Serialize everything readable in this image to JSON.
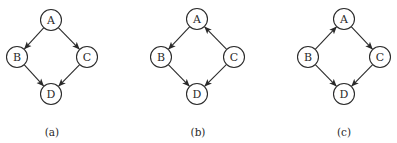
{
  "diagrams": [
    {
      "caption": "(a)",
      "caption_pos": [
        52,
        132
      ],
      "nodes": [
        {
          "id": "A",
          "label": "A",
          "x": 51,
          "y": 20
        },
        {
          "id": "B",
          "label": "B",
          "x": 17,
          "y": 57
        },
        {
          "id": "C",
          "label": "C",
          "x": 87,
          "y": 57
        },
        {
          "id": "D",
          "label": "D",
          "x": 51,
          "y": 94
        }
      ],
      "edges": [
        {
          "from": "A",
          "to": "B"
        },
        {
          "from": "A",
          "to": "C"
        },
        {
          "from": "B",
          "to": "D"
        },
        {
          "from": "C",
          "to": "D"
        }
      ]
    },
    {
      "caption": "(b)",
      "caption_pos": [
        198,
        132
      ],
      "nodes": [
        {
          "id": "A",
          "label": "A",
          "x": 197,
          "y": 19
        },
        {
          "id": "B",
          "label": "B",
          "x": 161,
          "y": 57
        },
        {
          "id": "C",
          "label": "C",
          "x": 234,
          "y": 57
        },
        {
          "id": "D",
          "label": "D",
          "x": 197,
          "y": 94
        }
      ],
      "edges": [
        {
          "from": "A",
          "to": "B"
        },
        {
          "from": "C",
          "to": "A"
        },
        {
          "from": "B",
          "to": "D"
        },
        {
          "from": "C",
          "to": "D"
        }
      ]
    },
    {
      "caption": "(c)",
      "caption_pos": [
        344,
        132
      ],
      "nodes": [
        {
          "id": "A",
          "label": "A",
          "x": 344,
          "y": 19
        },
        {
          "id": "B",
          "label": "B",
          "x": 308,
          "y": 57
        },
        {
          "id": "C",
          "label": "C",
          "x": 380,
          "y": 57
        },
        {
          "id": "D",
          "label": "D",
          "x": 344,
          "y": 94
        }
      ],
      "edges": [
        {
          "from": "B",
          "to": "A"
        },
        {
          "from": "A",
          "to": "C"
        },
        {
          "from": "B",
          "to": "D"
        },
        {
          "from": "C",
          "to": "D"
        }
      ]
    }
  ],
  "style": {
    "node_radius": 10.5,
    "stroke_color": "#2a2a2a"
  }
}
